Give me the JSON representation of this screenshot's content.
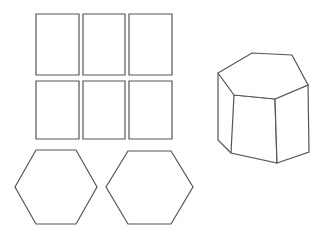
{
  "figure": {
    "background_color": "#ffffff",
    "stroke_color": "#555555",
    "fill_color": "#ffffff",
    "stroke_width": 1.2,
    "canvas": {
      "width": 323,
      "height": 238
    }
  },
  "net": {
    "label": "Net of a hexagonal prism",
    "lateral_faces": {
      "label": "Rectangular lateral faces",
      "count": 6,
      "rows": 2,
      "columns": 3,
      "rectangles": [
        {
          "name": "rect-r1c1",
          "x": 36,
          "y": 14,
          "width": 43,
          "height": 61
        },
        {
          "name": "rect-r1c2",
          "x": 83,
          "y": 14,
          "width": 42,
          "height": 61
        },
        {
          "name": "rect-r1c3",
          "x": 129,
          "y": 14,
          "width": 43,
          "height": 61
        },
        {
          "name": "rect-r2c1",
          "x": 36,
          "y": 81,
          "width": 43,
          "height": 58
        },
        {
          "name": "rect-r2c2",
          "x": 83,
          "y": 81,
          "width": 42,
          "height": 58
        },
        {
          "name": "rect-r2c3",
          "x": 129,
          "y": 81,
          "width": 43,
          "height": 58
        }
      ]
    },
    "bases": {
      "label": "Hexagonal bases",
      "count": 2,
      "orientation": "flat-top",
      "hexagons": [
        {
          "name": "hexagon-base-left",
          "points": "36,150 76,150 97,187 76,224 36,224 15,187"
        },
        {
          "name": "hexagon-base-right",
          "points": "128,151 171,151 193,187 171,224 128,224 106,187"
        }
      ]
    }
  },
  "solid": {
    "label": "Hexagonal prism (isometric view)",
    "faces": [
      {
        "name": "prism-top-face",
        "label": "Top hexagonal face",
        "points": "218,73 252,53 292,55 308,85 275,99 234,95"
      },
      {
        "name": "prism-front-left-face",
        "label": "Front-left lateral face",
        "points": "234,95 275,99 277,163 231,153"
      },
      {
        "name": "prism-front-right-face",
        "label": "Front-right lateral face",
        "points": "275,99 308,85 309,152 277,163"
      }
    ],
    "edges": [
      {
        "name": "prism-left-silhouette-edge",
        "points": "218,73 218,140 231,153"
      },
      {
        "name": "prism-left-back-edge",
        "points": "218,140 231,153"
      }
    ]
  }
}
